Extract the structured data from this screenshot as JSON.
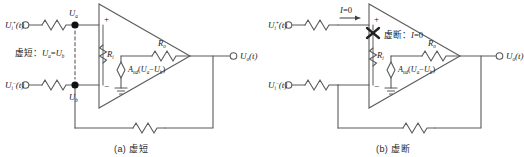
{
  "figure": {
    "panels": [
      {
        "id": "a",
        "caption": "（a）虚短",
        "caption_label": "(a)",
        "caption_text": "虚短",
        "annotation": "虚短：Uₐ=U_b",
        "annotation_prefix": "虚短",
        "annotation_colon": "：",
        "annotation_expr_u": "U",
        "annotation_sub_a": "a",
        "annotation_eq": "=",
        "annotation_sub_b": "b",
        "input_plus": {
          "symbol": "U",
          "sub": "i",
          "sup": "+",
          "arg": "(t)"
        },
        "input_minus": {
          "symbol": "U",
          "sub": "i",
          "sup": "−",
          "arg": "(t)"
        },
        "output": {
          "symbol": "U",
          "sub": "o",
          "arg": "(t)"
        },
        "node_a_label": {
          "symbol": "U",
          "sub": "a"
        },
        "node_b_label": {
          "symbol": "U",
          "sub": "b"
        },
        "input_resistance": {
          "symbol": "R",
          "sub": "i"
        },
        "output_resistance": {
          "symbol": "R",
          "sub": "o"
        },
        "dependent_source": {
          "gain": "A",
          "gain_sub": "ud",
          "open": "(",
          "u1": "U",
          "u1_sub": "a",
          "minus": "−",
          "u2": "U",
          "u2_sub": "b",
          "close": ")"
        },
        "terminal_plus": "+",
        "terminal_minus": "−",
        "has_short_marker": true,
        "has_break_marker": false
      },
      {
        "id": "b",
        "caption": "（b）虚断",
        "caption_label": "(b)",
        "caption_text": "虚断",
        "annotation": "虚断：I=0",
        "annotation_prefix": "虚断",
        "annotation_colon": "：",
        "annotation_current": "I",
        "annotation_eq": "=",
        "annotation_value": "0",
        "current_label": {
          "symbol": "I",
          "eq": "=",
          "value": "0"
        },
        "input_plus": {
          "symbol": "U",
          "sub": "i",
          "sup": "+",
          "arg": "(t)"
        },
        "input_minus": {
          "symbol": "U",
          "sub": "i",
          "sup": "−",
          "arg": "(t)"
        },
        "output": {
          "symbol": "U",
          "sub": "o",
          "arg": "(t)"
        },
        "input_resistance": {
          "symbol": "R",
          "sub": "i"
        },
        "output_resistance": {
          "symbol": "R",
          "sub": "o"
        },
        "dependent_source": {
          "gain": "A",
          "gain_sub": "ud",
          "open": "(",
          "u1": "U",
          "u1_sub": "a",
          "minus": "−",
          "u2": "U",
          "u2_sub": "b",
          "close": ")"
        },
        "terminal_plus": "+",
        "terminal_minus": "−",
        "has_short_marker": false,
        "has_break_marker": true
      }
    ]
  },
  "colors": {
    "background": "#ffffff",
    "wire": "#5a5a5a",
    "wire_dark": "#3d3d3d",
    "node_fill": "#111111",
    "text": "#1a1a1a",
    "marker": "#222222"
  }
}
